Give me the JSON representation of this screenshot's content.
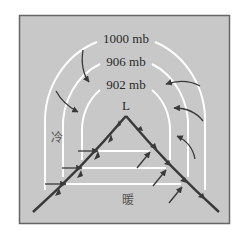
{
  "diagram": {
    "colors": {
      "background": "#c8c8c8",
      "frame": "#666666",
      "isobar": "#ffffff",
      "front": "#3a3a3a",
      "arrow": "#3a3a3a"
    },
    "isobars": [
      {
        "label": "1000 mb"
      },
      {
        "label": "906 mb"
      },
      {
        "label": "902 mb"
      }
    ],
    "low_label": "L",
    "cold_label": "冷",
    "warm_label": "暖"
  }
}
